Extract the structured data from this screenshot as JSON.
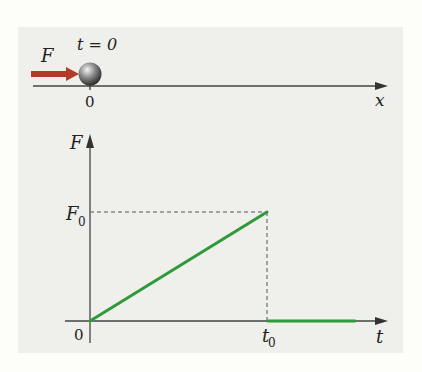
{
  "top_diagram": {
    "time_label": "t = 0",
    "force_label": "F",
    "origin_label": "0",
    "axis_label": "x",
    "arrow_color": "#b23a2a",
    "ball_color": "#555555"
  },
  "chart_data": {
    "type": "line",
    "title": "",
    "xlabel": "t",
    "ylabel": "F",
    "x_ticks": [
      {
        "value": 0,
        "label": "0"
      },
      {
        "value": 1,
        "label": "t0"
      }
    ],
    "y_ticks": [
      {
        "value": 0,
        "label": "0"
      },
      {
        "value": 1,
        "label": "F0"
      }
    ],
    "xlim": [
      0,
      1.65
    ],
    "ylim": [
      0,
      1.7
    ],
    "series": [
      {
        "name": "ramp",
        "color": "#2e9a3a",
        "points": [
          [
            0,
            0
          ],
          [
            1,
            1
          ]
        ]
      },
      {
        "name": "zero",
        "color": "#2e9a3a",
        "points": [
          [
            1,
            0
          ],
          [
            1.5,
            0
          ]
        ]
      }
    ],
    "guides": [
      {
        "type": "hline-dashed",
        "y": 1,
        "x_from": 0,
        "x_to": 1
      },
      {
        "type": "vline-dashed",
        "x": 1,
        "y_from": 0,
        "y_to": 1
      }
    ],
    "labels": {
      "origin": "0",
      "t0": "t",
      "t0_sub": "0",
      "F0": "F",
      "F0_sub": "0",
      "x_axis": "t",
      "y_axis": "F"
    }
  }
}
